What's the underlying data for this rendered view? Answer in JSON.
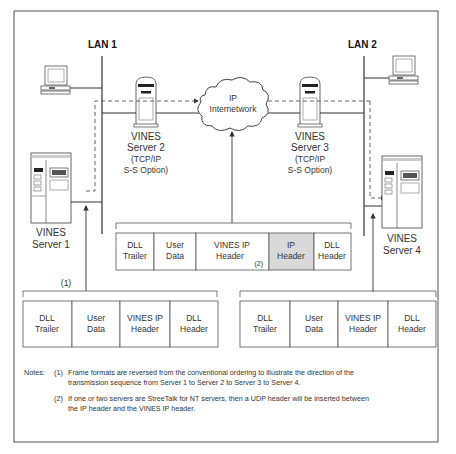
{
  "diagram": {
    "lan1_label": "LAN 1",
    "lan2_label": "LAN 2",
    "cloud_label_line1": "IP",
    "cloud_label_line2": "Internetwork",
    "servers": [
      {
        "id": "server1",
        "line1": "VINES",
        "line2": "Server 1"
      },
      {
        "id": "server2",
        "line1": "VINES",
        "line2": "Server 2",
        "line3": "(TCP/IP",
        "line4": "S-S Option)"
      },
      {
        "id": "server3",
        "line1": "VINES",
        "line2": "Server 3",
        "line3": "(TCP/IP",
        "line4": "S-S Option)"
      },
      {
        "id": "server4",
        "line1": "VINES",
        "line2": "Server 4"
      }
    ],
    "frame_left": {
      "marker": "(1)",
      "cells": [
        {
          "line1": "DLL",
          "line2": "Trailer"
        },
        {
          "line1": "User",
          "line2": "Data"
        },
        {
          "line1": "VINES IP",
          "line2": "Header"
        },
        {
          "line1": "DLL",
          "line2": "Header"
        }
      ]
    },
    "frame_middle": {
      "cells": [
        {
          "line1": "DLL",
          "line2": "Trailer"
        },
        {
          "line1": "User",
          "line2": "Data"
        },
        {
          "line1": "VINES  IP",
          "line2": "Header",
          "marker": "(2)"
        },
        {
          "line1": "IP",
          "line2": "Header",
          "highlight": true
        },
        {
          "line1": "DLL",
          "line2": "Header"
        }
      ],
      "highlight_color": "#d9d9d9"
    },
    "frame_right": {
      "cells": [
        {
          "line1": "DLL",
          "line2": "Trailer"
        },
        {
          "line1": "User",
          "line2": "Data"
        },
        {
          "line1": "VINES IP",
          "line2": "Header"
        },
        {
          "line1": "DLL",
          "line2": "Header"
        }
      ]
    }
  },
  "notes": {
    "heading": "Notes:",
    "items": [
      {
        "num": "(1)",
        "line1": "Frame formats are reversed from the conventional ordering to illustrate the direction of the",
        "line2": "transmission sequence from Server 1 to Server 2 to Server 3 to Server 4."
      },
      {
        "num": "(2)",
        "line1": "If one or two servers are StreeTalk for NT servers, then a UDP header will be inserted between",
        "line2": "the IP header and the VINES IP header."
      }
    ]
  }
}
